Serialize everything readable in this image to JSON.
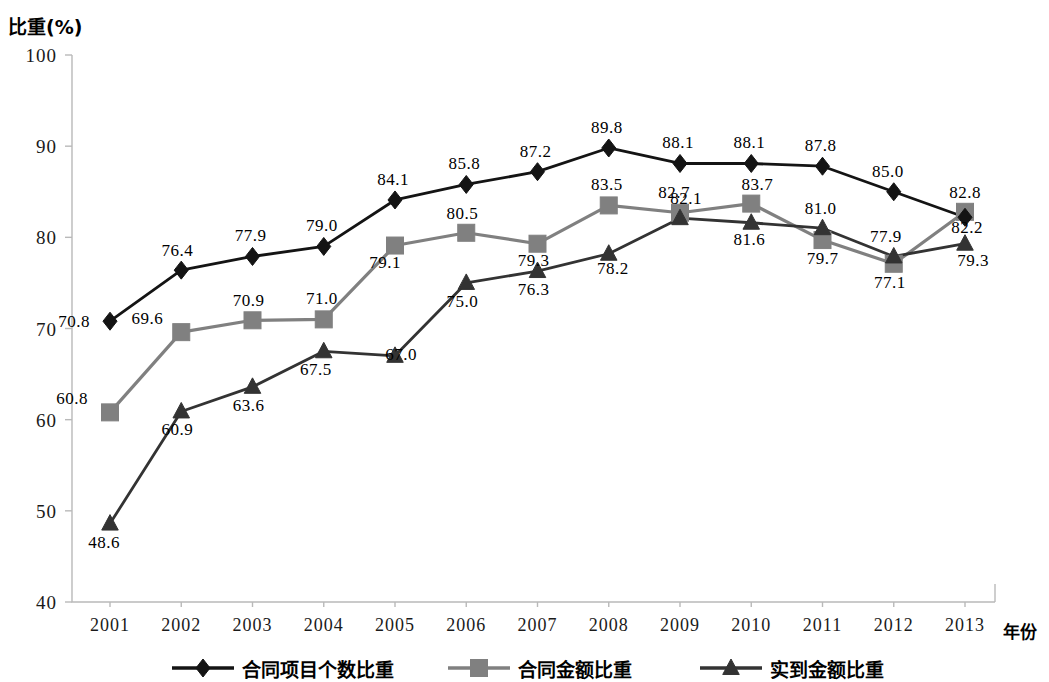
{
  "chart_data": {
    "type": "line",
    "title": "",
    "xlabel": "年份",
    "ylabel": "比重(%)",
    "ylim": [
      40,
      100
    ],
    "yticks": [
      40,
      50,
      60,
      70,
      80,
      90,
      100
    ],
    "grid": false,
    "legend_position": "bottom",
    "categories": [
      "2001",
      "2002",
      "2003",
      "2004",
      "2005",
      "2006",
      "2007",
      "2008",
      "2009",
      "2010",
      "2011",
      "2012",
      "2013"
    ],
    "series": [
      {
        "name": "合同项目个数比重",
        "marker": "diamond",
        "color": "#141414",
        "values": [
          70.8,
          76.4,
          77.9,
          79.0,
          84.1,
          85.8,
          87.2,
          89.8,
          88.1,
          88.1,
          87.8,
          85.0,
          82.2
        ],
        "labels": [
          "70.8",
          "76.4",
          "77.9",
          "79.0",
          "84.1",
          "85.8",
          "87.2",
          "89.8",
          "88.1",
          "88.1",
          "87.8",
          "85.0",
          "82.2"
        ]
      },
      {
        "name": "合同金额比重",
        "marker": "square",
        "color": "#808080",
        "values": [
          60.8,
          69.6,
          70.9,
          71.0,
          79.1,
          80.5,
          79.3,
          83.5,
          82.7,
          83.7,
          79.7,
          77.1,
          82.8
        ],
        "labels": [
          "60.8",
          "69.6",
          "70.9",
          "71.0",
          "79.1",
          "80.5",
          "79.3",
          "83.5",
          "82.7",
          "83.7",
          "79.7",
          "77.1",
          "82.8"
        ]
      },
      {
        "name": "实到金额比重",
        "marker": "triangle",
        "color": "#333333",
        "values": [
          48.6,
          60.9,
          63.6,
          67.5,
          67.0,
          75.0,
          76.3,
          78.2,
          82.1,
          81.6,
          81.0,
          77.9,
          79.3
        ],
        "labels": [
          "48.6",
          "60.9",
          "63.6",
          "67.5",
          "67.0",
          "75.0",
          "76.3",
          "78.2",
          "82.1",
          "81.6",
          "81.0",
          "77.9",
          "79.3"
        ]
      }
    ],
    "label_offsets": {
      "合同项目个数比重": [
        [
          -36,
          6
        ],
        [
          -4,
          -14
        ],
        [
          -2,
          -15
        ],
        [
          -2,
          -15
        ],
        [
          -2,
          -15
        ],
        [
          -2,
          -15
        ],
        [
          -2,
          -15
        ],
        [
          -2,
          -15
        ],
        [
          -2,
          -15
        ],
        [
          -2,
          -15
        ],
        [
          -2,
          -15
        ],
        [
          -6,
          -15
        ],
        [
          2,
          16
        ]
      ],
      "合同金额比重": [
        [
          -38,
          -8
        ],
        [
          -34,
          -8
        ],
        [
          -4,
          -14
        ],
        [
          -2,
          -15
        ],
        [
          -10,
          22
        ],
        [
          -4,
          -14
        ],
        [
          -4,
          22
        ],
        [
          -2,
          -15
        ],
        [
          -6,
          -15
        ],
        [
          6,
          -14
        ],
        [
          0,
          24
        ],
        [
          -4,
          24
        ],
        [
          0,
          -14
        ]
      ],
      "实到金额比重": [
        [
          -6,
          24
        ],
        [
          -4,
          24
        ],
        [
          -4,
          24
        ],
        [
          -8,
          24
        ],
        [
          6,
          4
        ],
        [
          -4,
          24
        ],
        [
          -4,
          24
        ],
        [
          4,
          20
        ],
        [
          6,
          -14
        ],
        [
          -2,
          22
        ],
        [
          -2,
          -14
        ],
        [
          -8,
          -14
        ],
        [
          8,
          22
        ]
      ]
    }
  },
  "legend": {
    "items": [
      {
        "label": "合同项目个数比重",
        "marker": "diamond",
        "color": "#141414"
      },
      {
        "label": "合同金额比重",
        "marker": "square",
        "color": "#808080"
      },
      {
        "label": "实到金额比重",
        "marker": "triangle",
        "color": "#333333"
      }
    ]
  }
}
